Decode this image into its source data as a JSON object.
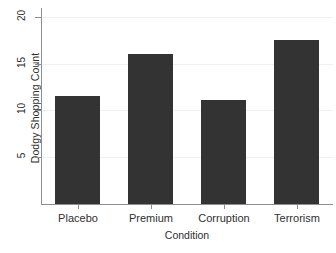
{
  "chart_data": {
    "type": "bar",
    "title": "",
    "xlabel": "Condition",
    "ylabel": "Dodgy Shopping Count",
    "categories": [
      "Placebo",
      "Premium",
      "Corruption",
      "Terrorism"
    ],
    "values": [
      11.5,
      16.0,
      11.1,
      17.5
    ],
    "ylim": [
      0,
      20.7
    ],
    "yticks": [
      5,
      10,
      15,
      20
    ],
    "ytick_labels": [
      "5",
      "10",
      "15",
      "20"
    ],
    "grid": "horizontal-light",
    "legend": "none",
    "bar_color": "#333333",
    "axis_color": "#8e8e8e",
    "background_color": "#ffffff"
  },
  "axes": {
    "y_title": "Dodgy Shopping Count",
    "x_title": "Condition",
    "ytick_0": "5",
    "ytick_1": "10",
    "ytick_2": "15",
    "ytick_3": "20",
    "xtick_0": "Placebo",
    "xtick_1": "Premium",
    "xtick_2": "Corruption",
    "xtick_3": "Terrorism"
  }
}
